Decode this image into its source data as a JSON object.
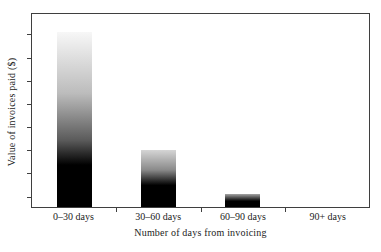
{
  "chart_data": {
    "type": "bar",
    "title": "",
    "xlabel": "Number of days from invoicing",
    "ylabel": "Value of invoices paid ($)",
    "categories": [
      "0–30 days",
      "30–60 days",
      "60–90 days",
      "90+ days"
    ],
    "values_relative_pct": [
      91,
      29,
      7,
      0
    ],
    "y_axis_numeric_labels": false,
    "grid": false,
    "legend": false,
    "ylim_note": "no numeric tick labels shown; bar heights are relative to plot height",
    "frame_color": "#3f3f3f",
    "text_color": "#1c1c1c",
    "background_color": "#ffffff",
    "y_tick_positions_pct": [
      10.3,
      22.7,
      34.5,
      46.4,
      58.8,
      70.6,
      82.5,
      94.8
    ],
    "x_tick_positions_pct": [
      25,
      50,
      75
    ],
    "bar_style": "each bar shades vertically from light gray at its top to solid black at its base",
    "bars": [
      {
        "category": "0–30 days",
        "height_pct": 90.7,
        "gradient_stops": [
          {
            "color": "#f7f7f7",
            "pos": 0
          },
          {
            "color": "#bcbcbc",
            "pos": 35
          },
          {
            "color": "#5a5a5a",
            "pos": 62
          },
          {
            "color": "#000000",
            "pos": 76
          }
        ]
      },
      {
        "category": "30–60 days",
        "height_pct": 29.4,
        "gradient_stops": [
          {
            "color": "#d5d5d5",
            "pos": 0
          },
          {
            "color": "#8a8a8a",
            "pos": 35
          },
          {
            "color": "#000000",
            "pos": 62
          }
        ]
      },
      {
        "category": "60–90 days",
        "height_pct": 6.7,
        "gradient_stops": [
          {
            "color": "#a5a5a5",
            "pos": 0
          },
          {
            "color": "#000000",
            "pos": 55
          }
        ]
      },
      {
        "category": "90+ days",
        "height_pct": 0,
        "gradient_stops": [
          {
            "color": "#000000",
            "pos": 0
          }
        ]
      }
    ]
  }
}
